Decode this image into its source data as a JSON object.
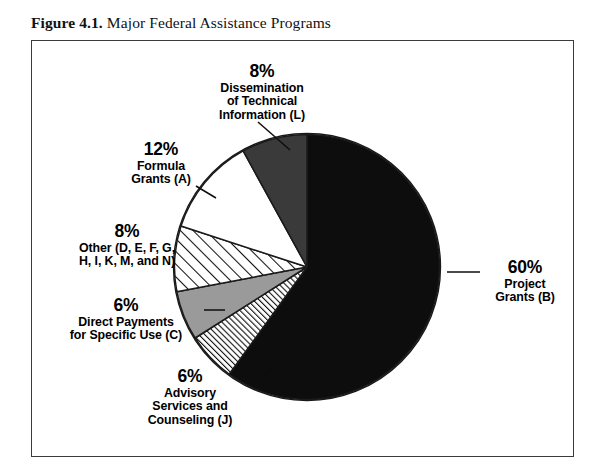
{
  "figure": {
    "number": "Figure 4.1.",
    "title": "Major Federal Assistance Programs"
  },
  "chart_data": {
    "type": "pie",
    "title": "Major Federal Assistance Programs",
    "xlabel": "",
    "ylabel": "",
    "legend_position": "callout-labels",
    "grid": false,
    "total_percent": 100,
    "categories": [
      "Project Grants (B)",
      "Dissemination of Technical Information (L)",
      "Formula Grants (A)",
      "Other (D, E, F, G, H, I, K, M, and N)",
      "Direct Payments for Specific Use (C)",
      "Advisory Services and Counseling (J)"
    ],
    "values": [
      60,
      8,
      12,
      8,
      6,
      6
    ],
    "slices": [
      {
        "key": "b",
        "percent_label": "60%",
        "value": 60,
        "name_line1": "Project",
        "name_line2": "Grants (B)",
        "name_full": "Project Grants (B)",
        "fill": "#0d0d0d",
        "pattern": "solid-black",
        "start_angle_deg": 0,
        "end_angle_deg": 216
      },
      {
        "key": "j",
        "percent_label": "6%",
        "value": 6,
        "name_line1": "Advisory",
        "name_line2": "Services and",
        "name_line3": "Counseling (J)",
        "name_full": "Advisory Services and Counseling (J)",
        "fill": "#ffffff",
        "pattern": "dense-diagonal-hatch",
        "start_angle_deg": 216,
        "end_angle_deg": 237.6
      },
      {
        "key": "c",
        "percent_label": "6%",
        "value": 6,
        "name_line1": "Direct Payments",
        "name_line2": "for Specific Use (C)",
        "name_full": "Direct Payments for Specific Use (C)",
        "fill": "#9a9a9a",
        "pattern": "solid-gray",
        "start_angle_deg": 237.6,
        "end_angle_deg": 259.2
      },
      {
        "key": "other",
        "percent_label": "8%",
        "value": 8,
        "name_line1": "Other (D, E, F, G,",
        "name_line2": "H, I, K, M, and N)",
        "name_full": "Other (D, E, F, G, H, I, K, M, and N)",
        "fill": "#ffffff",
        "pattern": "wide-diagonal-hatch",
        "start_angle_deg": 259.2,
        "end_angle_deg": 288
      },
      {
        "key": "a",
        "percent_label": "12%",
        "value": 12,
        "name_line1": "Formula",
        "name_line2": "Grants (A)",
        "name_full": "Formula Grants (A)",
        "fill": "#ffffff",
        "pattern": "solid-white",
        "start_angle_deg": 288,
        "end_angle_deg": 331.2
      },
      {
        "key": "l",
        "percent_label": "8%",
        "value": 8,
        "name_line1": "Dissemination",
        "name_line2": "of Technical",
        "name_line3": "Information (L)",
        "name_full": "Dissemination of Technical Information (L)",
        "fill": "#3a3a3a",
        "pattern": "solid-dark-gray",
        "start_angle_deg": 331.2,
        "end_angle_deg": 360
      }
    ],
    "colors": {
      "black": "#0d0d0d",
      "dark_gray": "#3a3a3a",
      "mid_gray": "#9a9a9a",
      "white": "#ffffff",
      "outline": "#1a1a1a",
      "frame": "#3b3b3b"
    }
  }
}
